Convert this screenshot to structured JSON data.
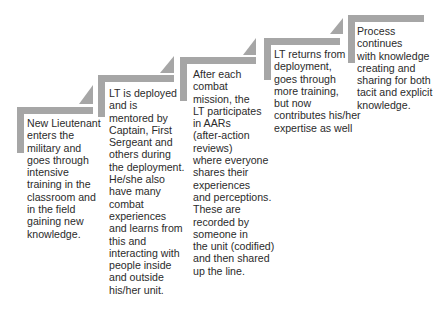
{
  "diagram": {
    "type": "staircase-process",
    "colors": {
      "bar": "#a6a6a6",
      "text": "#2b2b2b",
      "background": "#ffffff"
    },
    "steps": [
      {
        "text": "New Lieutenant\nenters the\nmilitary and\ngoes through\nintensive\ntraining in the\nclassroom and\nin the field\ngaining new\nknowledge."
      },
      {
        "text": "LT is deployed\nand is\nmentored by\nCaptain, First\nSergeant and\nothers during\nthe deployment.\nHe/she also\nhave many\ncombat\nexperiences\nand learns from\nthis and\ninteracting with\npeople inside\nand outside\nhis/her unit."
      },
      {
        "text": "After each\ncombat\nmission, the\nLT participates\nin AARs\n(after-action\nreviews)\nwhere everyone\nshares their\nexperiences\nand perceptions.\nThese are\nrecorded by\nsomeone in\nthe unit (codified)\nand then shared\nup the line."
      },
      {
        "text": "LT returns from\ndeployment,\ngoes through\nmore training,\nbut now\ncontributes his/her\nexpertise as well"
      },
      {
        "text": "Process\ncontinues\nwith knowledge\ncreating and\nsharing for both\ntacit and explicit\nknowledge."
      }
    ]
  }
}
